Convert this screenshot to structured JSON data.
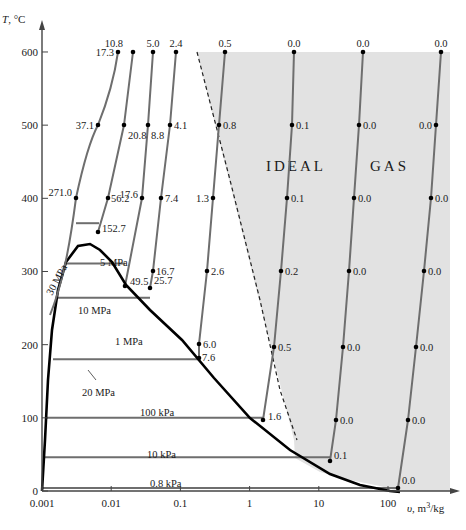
{
  "chart_data": {
    "type": "line",
    "title": "",
    "xlabel": "v, m³/kg",
    "ylabel": "T, °C",
    "xscale": "log",
    "xlim": [
      0.001,
      300
    ],
    "ylim": [
      0,
      620
    ],
    "x_ticks": [
      {
        "value": 0.001,
        "label": "0.001"
      },
      {
        "value": 0.01,
        "label": "0.01"
      },
      {
        "value": 0.1,
        "label": "0.1"
      },
      {
        "value": 1,
        "label": "1"
      },
      {
        "value": 10,
        "label": "10"
      },
      {
        "value": 100,
        "label": "100"
      }
    ],
    "y_ticks": [
      {
        "value": 0,
        "label": "0"
      },
      {
        "value": 100,
        "label": "100"
      },
      {
        "value": 200,
        "label": "200"
      },
      {
        "value": 300,
        "label": "300"
      },
      {
        "value": 400,
        "label": "400"
      },
      {
        "value": 500,
        "label": "500"
      },
      {
        "value": 600,
        "label": "600"
      }
    ],
    "grid": false,
    "region_label": {
      "text": "IDEAL  GAS",
      "words": [
        "IDEAL",
        "GAS"
      ]
    },
    "annotation": "Percent error in ideal-gas assumption for superheated steam at data points",
    "saturation_dome": {
      "description": "Saturated liquid and vapor lines",
      "points_px": [
        [
          42,
          491
        ],
        [
          45,
          440
        ],
        [
          48,
          380
        ],
        [
          52,
          330
        ],
        [
          58,
          290
        ],
        [
          66,
          262
        ],
        [
          78,
          246
        ],
        [
          90,
          244
        ],
        [
          100,
          250
        ],
        [
          112,
          262
        ],
        [
          126,
          285
        ],
        [
          150,
          310
        ],
        [
          182,
          340
        ],
        [
          214,
          378
        ],
        [
          250,
          418
        ],
        [
          290,
          450
        ],
        [
          330,
          474
        ],
        [
          360,
          485
        ],
        [
          390,
          491
        ],
        [
          400,
          492
        ]
      ]
    },
    "isobars_horizontal": [
      {
        "label": "20 MPa",
        "y_value": 366
      },
      {
        "label": "10 MPa",
        "y_value": 311
      },
      {
        "label": "5 MPa",
        "y_value": 264
      },
      {
        "label": "1 MPa",
        "y_value": 180
      },
      {
        "label": "100 kPa",
        "y_value": 100
      },
      {
        "label": "10 kPa",
        "y_value": 46
      },
      {
        "label": "0.8 kPa",
        "y_value": 4
      }
    ],
    "superheated_isobars": [
      {
        "pressure": "30 MPa",
        "points": [
          {
            "T": 600,
            "label": "17.3"
          },
          {
            "T": 500,
            "label": "37.1"
          },
          {
            "T": 400,
            "label": "271.0"
          }
        ]
      },
      {
        "pressure": "20 MPa",
        "points": [
          {
            "T": 600,
            "label": "10.8"
          },
          {
            "T": 500,
            "label": "20.8"
          },
          {
            "T": 400,
            "label": "56.2"
          },
          {
            "T": 366,
            "label": "152.7"
          }
        ]
      },
      {
        "pressure": "10 MPa",
        "points": [
          {
            "T": 600,
            "label": "5.0"
          },
          {
            "T": 500,
            "label": "8.8"
          },
          {
            "T": 400,
            "label": "17.6"
          },
          {
            "T": 311,
            "label": "49.5"
          }
        ]
      },
      {
        "pressure": "5 MPa",
        "points": [
          {
            "T": 600,
            "label": "2.4"
          },
          {
            "T": 500,
            "label": "4.1"
          },
          {
            "T": 400,
            "label": "7.4"
          },
          {
            "T": 300,
            "label": "16.7"
          },
          {
            "T": 264,
            "label": "25.7"
          }
        ]
      },
      {
        "pressure": "1 MPa",
        "points": [
          {
            "T": 600,
            "label": "0.5"
          },
          {
            "T": 500,
            "label": "0.8"
          },
          {
            "T": 400,
            "label": "1.3"
          },
          {
            "T": 300,
            "label": "2.6"
          },
          {
            "T": 200,
            "label": "6.0"
          },
          {
            "T": 180,
            "label": "7.6"
          }
        ]
      },
      {
        "pressure": "100 kPa",
        "points": [
          {
            "T": 600,
            "label": "0.0"
          },
          {
            "T": 500,
            "label": "0.1"
          },
          {
            "T": 400,
            "label": "0.1"
          },
          {
            "T": 300,
            "label": "0.2"
          },
          {
            "T": 200,
            "label": "0.5"
          },
          {
            "T": 100,
            "label": "1.6"
          }
        ]
      },
      {
        "pressure": "10 kPa",
        "points": [
          {
            "T": 600,
            "label": "0.0"
          },
          {
            "T": 500,
            "label": "0.0"
          },
          {
            "T": 400,
            "label": "0.0"
          },
          {
            "T": 300,
            "label": "0.0"
          },
          {
            "T": 200,
            "label": "0.0"
          },
          {
            "T": 100,
            "label": "0.0"
          },
          {
            "T": 46,
            "label": "0.1"
          }
        ]
      },
      {
        "pressure": "0.8 kPa",
        "points": [
          {
            "T": 600,
            "label": "0.0"
          },
          {
            "T": 500,
            "label": "0.0"
          },
          {
            "T": 400,
            "label": "0.0"
          },
          {
            "T": 300,
            "label": "0.0"
          },
          {
            "T": 200,
            "label": "0.0"
          },
          {
            "T": 100,
            "label": "0.0"
          },
          {
            "T": 4,
            "label": "0.0"
          }
        ]
      }
    ],
    "colors": {
      "ideal_gas_region": "#e2e2e2",
      "dome": "#000000",
      "isobar": "#6e6e6e",
      "axis": "#444444",
      "marker": "#000000"
    }
  }
}
